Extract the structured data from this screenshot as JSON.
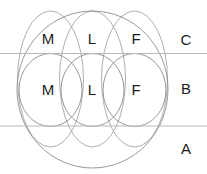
{
  "diagram": {
    "canvas": {
      "width": 207,
      "height": 174,
      "background": "#ffffff"
    },
    "colors": {
      "outline": "#8d8d8d",
      "outline_soft": "#a6a6a6",
      "band_line": "#b9b9b9",
      "label_text": "#1c1c1c"
    },
    "outer_circle": {
      "name": "outer-circle",
      "cx": 92.5,
      "cy": 89.5,
      "rx": 75.5,
      "ry": 78.5
    },
    "band_lines": [
      {
        "name": "upper-band-line",
        "y": 53.5,
        "x1": 0,
        "x2": 207
      },
      {
        "name": "lower-band-line",
        "y": 126.0,
        "x1": 0,
        "x2": 207
      }
    ],
    "band_labels": [
      {
        "id": "band-c",
        "label": "C",
        "x": 186,
        "y": 41
      },
      {
        "id": "band-b",
        "label": "B",
        "x": 186,
        "y": 90
      },
      {
        "id": "band-a",
        "label": "A",
        "x": 186,
        "y": 150
      }
    ],
    "tall_ellipses": [
      {
        "id": "tall-m",
        "label": "M",
        "cx": 50.5,
        "cy": 79.0,
        "rx": 33.0,
        "ry": 68.0
      },
      {
        "id": "tall-l",
        "label": "L",
        "cx": 92.5,
        "cy": 79.0,
        "rx": 33.0,
        "ry": 68.0
      },
      {
        "id": "tall-f",
        "label": "F",
        "cx": 134.5,
        "cy": 79.0,
        "rx": 33.0,
        "ry": 68.0
      }
    ],
    "band_b_ellipses": [
      {
        "id": "mid-m",
        "label": "M",
        "cx": 50.5,
        "cy": 90.0,
        "rx": 31.5,
        "ry": 36.5
      },
      {
        "id": "mid-l",
        "label": "L",
        "cx": 92.5,
        "cy": 90.0,
        "rx": 31.5,
        "ry": 36.5
      },
      {
        "id": "mid-f",
        "label": "F",
        "cx": 134.5,
        "cy": 90.0,
        "rx": 31.5,
        "ry": 36.5
      }
    ],
    "band_c_labels": [
      {
        "id": "top-m",
        "label": "M",
        "x": 48,
        "y": 40
      },
      {
        "id": "top-l",
        "label": "L",
        "x": 92,
        "y": 40
      },
      {
        "id": "top-f",
        "label": "F",
        "x": 136,
        "y": 40
      }
    ],
    "band_b_labels": [
      {
        "id": "center-m",
        "label": "M",
        "x": 48,
        "y": 91
      },
      {
        "id": "center-l",
        "label": "L",
        "x": 92,
        "y": 91
      },
      {
        "id": "center-f",
        "label": "F",
        "x": 136,
        "y": 91
      }
    ]
  }
}
